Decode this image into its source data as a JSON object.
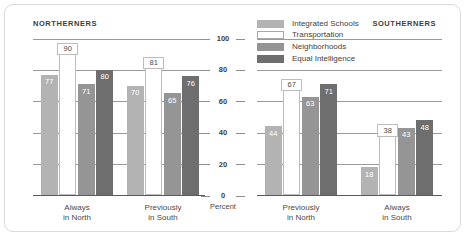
{
  "panel": {
    "left_title": "NORTHERNERS",
    "right_title": "SOUTHERNERS"
  },
  "legend": {
    "items": [
      {
        "label": "Integrated Schools",
        "color": "#b3b3b3"
      },
      {
        "label": "Transportation",
        "color": "#ffffff"
      },
      {
        "label": "Neighborhoods",
        "color": "#959595"
      },
      {
        "label": "Equal Intelligence",
        "color": "#6e6e6e"
      }
    ]
  },
  "axis": {
    "unit_label": "Percent",
    "ticks": [
      "0",
      "20",
      "40",
      "60",
      "80",
      "100"
    ]
  },
  "chart_data": [
    {
      "type": "bar",
      "title": "NORTHERNERS",
      "categories": [
        "Always\nin North",
        "Previously\nin South"
      ],
      "category_lines": [
        [
          "Always",
          "in North"
        ],
        [
          "Previously",
          "in South"
        ]
      ],
      "series": [
        {
          "name": "Integrated Schools",
          "values": [
            77,
            70
          ],
          "color": "#b3b3b3"
        },
        {
          "name": "Transportation",
          "values": [
            90,
            81
          ],
          "color": "#ffffff"
        },
        {
          "name": "Neighborhoods",
          "values": [
            71,
            65
          ],
          "color": "#959595"
        },
        {
          "name": "Equal Intelligence",
          "values": [
            80,
            76
          ],
          "color": "#6e6e6e"
        }
      ],
      "xlabel": "",
      "ylabel": "Percent",
      "ylim": [
        0,
        100
      ],
      "yticks": [
        0,
        20,
        40,
        60,
        80,
        100
      ],
      "grid": true,
      "legend_position": "top-center"
    },
    {
      "type": "bar",
      "title": "SOUTHERNERS",
      "categories": [
        "Previously\nin North",
        "Always\nin South"
      ],
      "category_lines": [
        [
          "Previously",
          "in North"
        ],
        [
          "Always",
          "in South"
        ]
      ],
      "series": [
        {
          "name": "Integrated Schools",
          "values": [
            44,
            18
          ],
          "color": "#b3b3b3"
        },
        {
          "name": "Transportation",
          "values": [
            67,
            38
          ],
          "color": "#ffffff"
        },
        {
          "name": "Neighborhoods",
          "values": [
            63,
            43
          ],
          "color": "#959595"
        },
        {
          "name": "Equal Intelligence",
          "values": [
            71,
            48
          ],
          "color": "#6e6e6e"
        }
      ],
      "xlabel": "",
      "ylabel": "Percent",
      "ylim": [
        0,
        100
      ],
      "yticks": [
        0,
        20,
        40,
        60,
        80,
        100
      ],
      "grid": true,
      "legend_position": "top-center"
    }
  ]
}
